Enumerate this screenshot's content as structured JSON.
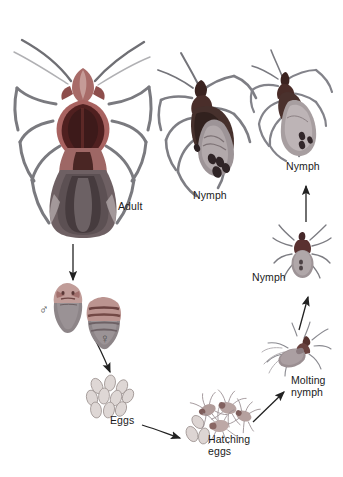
{
  "figure": {
    "background_color": "#ffffff",
    "width": 343,
    "height": 477
  },
  "palette": {
    "body_dark": "#4a3330",
    "body_darker": "#3a2422",
    "thorax_red": "#8d4c4c",
    "thorax_pink": "#b9807d",
    "abdomen_gray": "#8e8486",
    "abdomen_light": "#b5adae",
    "abdomen_dark": "#5d5154",
    "leg_gray": "#7c7c80",
    "egg_fill": "#ded6d4",
    "egg_stroke": "#9b9190",
    "text": "#1a1a1a",
    "arrow": "#2b2b2b"
  },
  "labels": [
    {
      "id": "adult",
      "text": "Adult",
      "x": 118,
      "y": 207,
      "lines": 1
    },
    {
      "id": "nymph-large",
      "text": "Nymph",
      "x": 193,
      "y": 196,
      "lines": 1
    },
    {
      "id": "nymph-small",
      "text": "Nymph",
      "x": 286,
      "y": 167,
      "lines": 1
    },
    {
      "id": "nymph-top",
      "text": "Nymph",
      "x": 252,
      "y": 278,
      "lines": 1
    },
    {
      "id": "molting-nymph",
      "text": "Molting\nnymph",
      "x": 291,
      "y": 381,
      "lines": 2
    },
    {
      "id": "eggs",
      "text": "Eggs",
      "x": 110,
      "y": 421,
      "lines": 1
    },
    {
      "id": "hatching-eggs",
      "text": "Hatching\neggs",
      "x": 208,
      "y": 440,
      "lines": 2
    }
  ],
  "symbols": [
    {
      "id": "male",
      "glyph": "♂",
      "x": 39,
      "y": 310,
      "name": "male-symbol"
    },
    {
      "id": "female",
      "glyph": "♀",
      "x": 100,
      "y": 339,
      "name": "female-symbol"
    }
  ],
  "stages": [
    {
      "id": "adult",
      "label": "Adult",
      "order": 1,
      "size": "large"
    },
    {
      "id": "nymph-large",
      "label": "Nymph",
      "order": 2,
      "size": "medium"
    },
    {
      "id": "nymph-small",
      "label": "Nymph",
      "order": 3,
      "size": "small"
    },
    {
      "id": "mating-pair",
      "label": "Mating pair",
      "order": 4,
      "size": "tiny"
    },
    {
      "id": "eggs",
      "label": "Eggs",
      "order": 5,
      "size": "tiny"
    },
    {
      "id": "hatching-eggs",
      "label": "Hatching eggs",
      "order": 6,
      "size": "tiny"
    },
    {
      "id": "molting-nymph",
      "label": "Molting nymph",
      "order": 7,
      "size": "tiny"
    },
    {
      "id": "nymph-top",
      "label": "Nymph",
      "order": 8,
      "size": "tiny"
    }
  ],
  "arrows": [
    {
      "id": "adult-to-pair",
      "from": "adult",
      "to": "mating-pair",
      "direction": "down"
    },
    {
      "id": "pair-to-eggs",
      "from": "mating-pair",
      "to": "eggs",
      "direction": "down-right"
    },
    {
      "id": "eggs-to-hatching",
      "from": "eggs",
      "to": "hatching-eggs",
      "direction": "right"
    },
    {
      "id": "hatching-to-molting",
      "from": "hatching-eggs",
      "to": "molting-nymph",
      "direction": "up-right"
    },
    {
      "id": "molting-to-nymph",
      "from": "molting-nymph",
      "to": "nymph-top",
      "direction": "up"
    },
    {
      "id": "nymph-to-small",
      "from": "nymph-top",
      "to": "nymph-small",
      "direction": "up"
    }
  ]
}
